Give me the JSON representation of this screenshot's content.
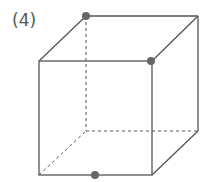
{
  "label": "(4)",
  "diagram": {
    "type": "cube",
    "line_color": "#555555",
    "hidden_edges": "dashed",
    "point_color": "#666666",
    "marked_points": [
      {
        "position": "back-top-left vertex"
      },
      {
        "position": "front-top-right vertex"
      },
      {
        "position": "front-bottom edge midpoint"
      }
    ]
  }
}
